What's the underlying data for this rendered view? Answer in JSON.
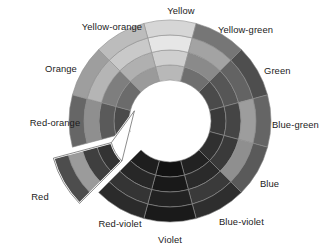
{
  "figure": {
    "name": "color-wheel",
    "background": "#ffffff",
    "center": {
      "x": 170,
      "y": 121
    },
    "radii": {
      "inner": 41,
      "r1": 56,
      "r2": 71,
      "r3": 86,
      "outer": 101
    },
    "ring_count": 4,
    "sector_count": 12,
    "sector_span_degrees": 30,
    "stroke": "#8d8d8d",
    "stroke_width": 0.6,
    "exploded_sector": "Red",
    "explode_offset": 22,
    "callout_stroke": "#ffffff",
    "callout_stroke_width": 2.2
  },
  "chart_data": {
    "type": "pie",
    "xlabel": "",
    "ylabel": "",
    "legend_position": "radial-outside",
    "grid": false,
    "categories": [
      "Yellow",
      "Yellow-green",
      "Green",
      "Blue-green",
      "Blue",
      "Blue-violet",
      "Violet",
      "Red-violet",
      "Red",
      "Red-orange",
      "Orange",
      "Yellow-orange"
    ],
    "values": [
      30,
      30,
      30,
      30,
      30,
      30,
      30,
      30,
      30,
      30,
      30,
      30
    ],
    "ring_names": [
      "ring-1-inner",
      "ring-2",
      "ring-3",
      "ring-4-outer"
    ],
    "series": [
      {
        "name": "ring-1-inner",
        "values": [
          "#b8b8b8",
          "#6f6f6f",
          "#4a4a4a",
          "#3a3a3a",
          "#303030",
          "#222222",
          "#121212",
          "#1e1e1e",
          "#333333",
          "#4a4a4a",
          "#6b6b6b",
          "#9a9a9a"
        ]
      },
      {
        "name": "ring-2",
        "values": [
          "#cfcfcf",
          "#8a8a8a",
          "#565656",
          "#454545",
          "#3a3a3a",
          "#2a2a2a",
          "#191919",
          "#272727",
          "#3f3f3f",
          "#5a5a5a",
          "#7e7e7e",
          "#b0b0b0"
        ]
      },
      {
        "name": "ring-3",
        "values": [
          "#e6e6e6",
          "#a3a3a3",
          "#636363",
          "#9d9d9d",
          "#8f8f8f",
          "#3a3a3a",
          "#222222",
          "#343434",
          "#9b9b9b",
          "#8f8f8f",
          "#b5b5b5",
          "#c9c9c9"
        ]
      },
      {
        "name": "ring-4-outer",
        "values": [
          "#d6d6d6",
          "#767676",
          "#4e4e4e",
          "#656565",
          "#5a5a5a",
          "#2e2e2e",
          "#1a1a1a",
          "#2b2b2b",
          "#4d4d4d",
          "#666666",
          "#9e9e9e",
          "#bcbcbc"
        ]
      }
    ]
  },
  "labels": [
    {
      "id": "yellow",
      "text": "Yellow",
      "x": 181,
      "y": 12,
      "anchor": "middle"
    },
    {
      "id": "yellow-green",
      "text": "Yellow-green",
      "x": 218,
      "y": 31,
      "anchor": "start"
    },
    {
      "id": "green",
      "text": "Green",
      "x": 264,
      "y": 72,
      "anchor": "start"
    },
    {
      "id": "blue-green",
      "text": "Blue-green",
      "x": 272,
      "y": 126,
      "anchor": "start"
    },
    {
      "id": "blue",
      "text": "Blue",
      "x": 260,
      "y": 185,
      "anchor": "start"
    },
    {
      "id": "blue-violet",
      "text": "Blue-violet",
      "x": 219,
      "y": 223,
      "anchor": "start"
    },
    {
      "id": "violet",
      "text": "Violet",
      "x": 170,
      "y": 241,
      "anchor": "middle"
    },
    {
      "id": "red-violet",
      "text": "Red-violet",
      "x": 120,
      "y": 225,
      "anchor": "middle"
    },
    {
      "id": "red",
      "text": "Red",
      "x": 40,
      "y": 198,
      "anchor": "middle"
    },
    {
      "id": "red-orange",
      "text": "Red-orange",
      "x": 55,
      "y": 124,
      "anchor": "middle"
    },
    {
      "id": "orange",
      "text": "Orange",
      "x": 61,
      "y": 70,
      "anchor": "middle"
    },
    {
      "id": "yellow-orange",
      "text": "Yellow-orange",
      "x": 112,
      "y": 28,
      "anchor": "middle"
    }
  ]
}
